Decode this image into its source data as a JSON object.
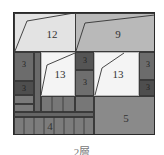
{
  "title": "2層",
  "rooms": [
    {
      "id": "room-12",
      "label": "12",
      "shade": "#e3e3e3"
    },
    {
      "id": "room-9",
      "label": "9",
      "shade": "#b7b7b7"
    },
    {
      "id": "room-13-left",
      "label": "13",
      "shade": "#f4f4f4"
    },
    {
      "id": "room-13-right",
      "label": "13",
      "shade": "#f4f4f4"
    },
    {
      "id": "room-3-left-top",
      "label": "3",
      "shade": "#6e6e6e"
    },
    {
      "id": "room-3-left-bottom",
      "label": "3",
      "shade": "#555555"
    },
    {
      "id": "room-3-mid-top",
      "label": "3",
      "shade": "#5a5a5a"
    },
    {
      "id": "room-3-mid-bottom",
      "label": "3",
      "shade": "#6e6e6e"
    },
    {
      "id": "room-3-right-top",
      "label": "3",
      "shade": "#6e6e6e"
    },
    {
      "id": "room-3-right-bottom",
      "label": "3",
      "shade": "#555555"
    },
    {
      "id": "room-4",
      "label": "4",
      "shade": "#7c7c7c"
    },
    {
      "id": "room-5",
      "label": "5",
      "shade": "#8a8a8a"
    }
  ],
  "labels": {
    "r12": "12",
    "r9": "9",
    "r13a": "13",
    "r13b": "13",
    "r3a": "3",
    "r3b": "3",
    "r3c": "3",
    "r3d": "3",
    "r3e": "3",
    "r3f": "3",
    "r4": "4",
    "r5": "5"
  },
  "colors": {
    "light": "#e3e3e3",
    "mid": "#b7b7b7",
    "white": "#f4f4f4",
    "dark": "#5a5a5a",
    "darker": "#4a4a4a",
    "gray": "#7c7c7c",
    "outline": "#2a2a2a"
  }
}
